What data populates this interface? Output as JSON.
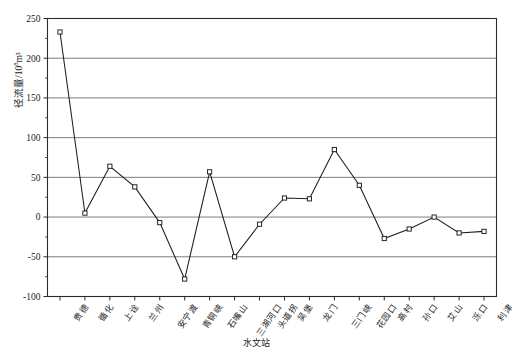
{
  "chart_data": {
    "type": "line",
    "title": "",
    "xlabel": "水文站",
    "ylabel_prefix": "径流量/10",
    "ylabel_sup": "8",
    "ylabel_suffix": "m³",
    "ylabel_full": "径流量/10⁸m³",
    "categories": [
      "贵德",
      "循化",
      "上诠",
      "兰州",
      "安宁渡",
      "青铜峡",
      "石嘴山",
      "三湖河口",
      "头道拐",
      "吴堡",
      "龙门",
      "三门峡",
      "花园口",
      "高村",
      "孙口",
      "艾山",
      "泺口",
      "利津"
    ],
    "values": [
      233,
      5,
      64,
      38,
      -7,
      -78,
      57,
      -50,
      -9,
      24,
      23,
      85,
      40,
      -27,
      -15,
      0,
      -20,
      -18
    ],
    "series": [
      {
        "name": "径流量",
        "values": [
          233,
          5,
          64,
          38,
          -7,
          -78,
          57,
          -50,
          -9,
          24,
          23,
          85,
          40,
          -27,
          -15,
          0,
          -20,
          -18
        ]
      }
    ],
    "ylim": [
      -100,
      250
    ],
    "yticks": [
      -100,
      -50,
      0,
      50,
      100,
      150,
      200,
      250
    ],
    "ytick_labels": [
      "-100",
      "-50",
      "0",
      "50",
      "100",
      "150",
      "200",
      "250"
    ],
    "grid": true,
    "grid_axis": "y",
    "legend": null,
    "marker": "square-open",
    "line_color": "#1c1c1c",
    "marker_fill": "#ffffff",
    "grid_color": "#6e6e6e",
    "background_color": "#ffffff"
  }
}
